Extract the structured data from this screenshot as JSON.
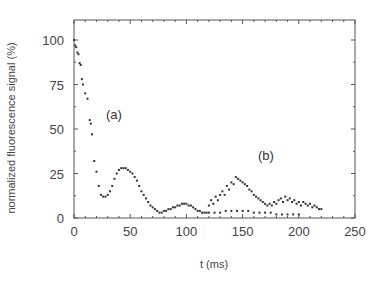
{
  "chart_data": {
    "type": "scatter",
    "title": "",
    "xlabel": "t (ms)",
    "ylabel": "normalized fluorescence signal  (%)",
    "xlim": [
      0,
      250
    ],
    "ylim": [
      0,
      110
    ],
    "xticks": [
      0,
      50,
      100,
      150,
      200,
      250
    ],
    "yticks": [
      0,
      25,
      50,
      75,
      100
    ],
    "grid": false,
    "legend": null,
    "annotations": [
      {
        "text": "(a)",
        "x": 28,
        "y": 58
      },
      {
        "text": "(b)",
        "x": 165,
        "y": 35
      }
    ],
    "series": [
      {
        "name": "(a)",
        "marker": "dot",
        "x": [
          0,
          1,
          2,
          3,
          4,
          5,
          6,
          7,
          8,
          10,
          12,
          14,
          15,
          16,
          18,
          20,
          22,
          24,
          26,
          28,
          30,
          32,
          34,
          36,
          38,
          40,
          42,
          44,
          46,
          48,
          50,
          52,
          54,
          56,
          58,
          60,
          62,
          64,
          66,
          68,
          70,
          72,
          74,
          76,
          78,
          80,
          82,
          84,
          86,
          88,
          90,
          92,
          94,
          96,
          98,
          100,
          102,
          104,
          106,
          108,
          110,
          112,
          114,
          116,
          118,
          120,
          125,
          130,
          135,
          140,
          145,
          150,
          155,
          160,
          165,
          170,
          175,
          180,
          185,
          190,
          195,
          200
        ],
        "y": [
          100,
          97,
          96,
          93,
          92,
          87,
          86,
          78,
          75,
          70,
          67,
          55,
          53,
          47,
          32,
          26,
          18,
          13,
          12,
          12,
          13,
          15,
          18,
          22,
          25,
          27,
          28,
          28,
          28,
          27,
          26,
          25,
          23,
          21,
          18,
          15,
          13,
          11,
          9,
          7,
          6,
          5,
          4,
          3,
          3,
          4,
          4,
          5,
          5,
          6,
          6,
          7,
          7,
          8,
          8,
          8,
          7,
          7,
          6,
          5,
          4,
          4,
          3,
          3,
          3,
          3,
          3,
          3,
          4,
          4,
          4,
          4,
          4,
          3,
          3,
          3,
          3,
          2,
          2,
          2,
          2,
          2
        ]
      },
      {
        "name": "(b)",
        "marker": "dot",
        "x": [
          120,
          122,
          124,
          126,
          128,
          130,
          132,
          134,
          136,
          138,
          140,
          142,
          144,
          146,
          148,
          150,
          152,
          154,
          156,
          158,
          160,
          162,
          164,
          166,
          168,
          170,
          172,
          174,
          176,
          178,
          180,
          182,
          184,
          186,
          188,
          190,
          192,
          194,
          196,
          198,
          200,
          202,
          204,
          206,
          208,
          210,
          212,
          214,
          216,
          218,
          220
        ],
        "y": [
          7,
          10,
          8,
          12,
          10,
          13,
          15,
          13,
          18,
          16,
          20,
          19,
          23,
          22,
          21,
          20,
          19,
          18,
          16,
          15,
          13,
          12,
          11,
          10,
          9,
          8,
          7,
          8,
          7,
          9,
          8,
          10,
          11,
          9,
          12,
          10,
          11,
          9,
          10,
          8,
          9,
          7,
          9,
          8,
          7,
          8,
          6,
          7,
          6,
          5,
          5
        ]
      }
    ]
  }
}
